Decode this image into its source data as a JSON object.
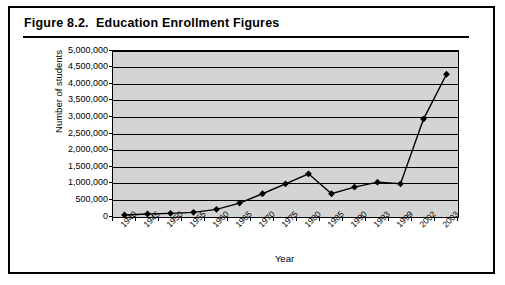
{
  "figure": {
    "title": "Figure 8.2.  Education Enrollment Figures"
  },
  "chart_data": {
    "type": "line",
    "title": "Education Enrollment Figures",
    "xlabel": "Year",
    "ylabel": "Number of students",
    "categories": [
      "1940",
      "1945",
      "1950",
      "1955",
      "1960",
      "1965",
      "1970",
      "1975",
      "1980",
      "1985",
      "1990",
      "1993",
      "1999",
      "2002",
      "2003"
    ],
    "values": [
      60000,
      90000,
      110000,
      140000,
      230000,
      420000,
      700000,
      1000000,
      1300000,
      700000,
      900000,
      1050000,
      1000000,
      2950000,
      4300000
    ],
    "series": [
      {
        "name": "Number of students",
        "values": [
          60000,
          90000,
          110000,
          140000,
          230000,
          420000,
          700000,
          1000000,
          1300000,
          700000,
          900000,
          1050000,
          1000000,
          2950000,
          4300000
        ]
      }
    ],
    "ylim": [
      0,
      5000000
    ],
    "ytick_values": [
      0,
      500000,
      1000000,
      1500000,
      2000000,
      2500000,
      3000000,
      3500000,
      4000000,
      4500000,
      5000000
    ],
    "ytick_labels": [
      "0",
      "500,000",
      "1,000,000",
      "1,500,000",
      "2,000,000",
      "2,500,000",
      "3,000,000",
      "3,500,000",
      "4,000,000",
      "4,500,000",
      "5,000,000"
    ],
    "grid": true,
    "legend": "none",
    "marker": "diamond",
    "line_color": "#000000",
    "plot_background": "#d4d4d4"
  }
}
